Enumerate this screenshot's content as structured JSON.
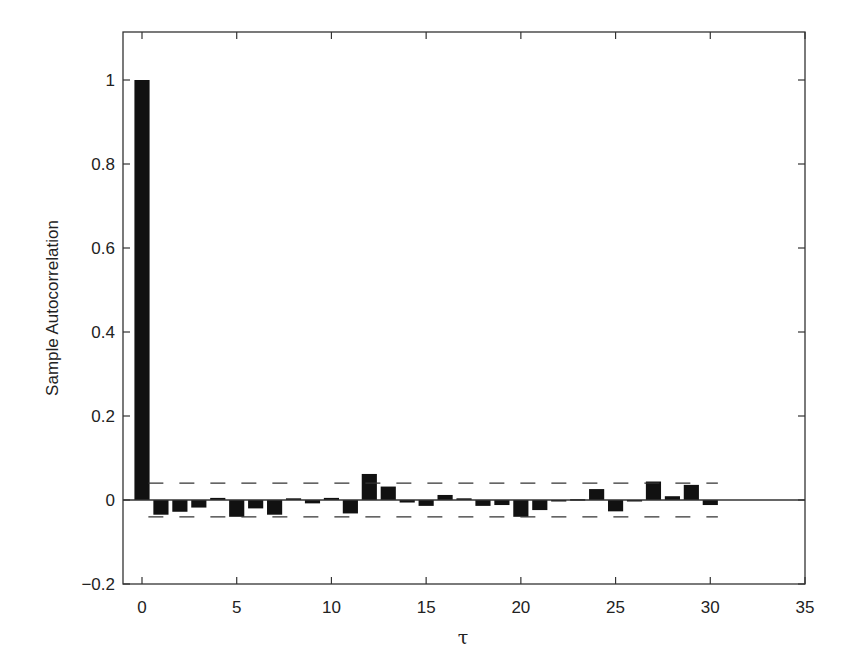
{
  "chart_data": {
    "type": "bar",
    "title": "",
    "xlabel": "τ",
    "ylabel": "Sample Autocorrelation",
    "xlim": [
      -1,
      35
    ],
    "ylim": [
      -0.2,
      1.1
    ],
    "xticks": [
      0,
      5,
      10,
      15,
      20,
      25,
      30,
      35
    ],
    "yticks": [
      -0.2,
      0,
      0.2,
      0.4,
      0.6,
      0.8,
      1
    ],
    "ytick_labels": [
      "−0.2",
      "0",
      "0.2",
      "0.4",
      "0.6",
      "0.8",
      "1"
    ],
    "xtick_labels": [
      "0",
      "5",
      "10",
      "15",
      "20",
      "25",
      "30",
      "35"
    ],
    "grid": false,
    "legend": null,
    "categories": [
      0,
      1,
      2,
      3,
      4,
      5,
      6,
      7,
      8,
      9,
      10,
      11,
      12,
      13,
      14,
      15,
      16,
      17,
      18,
      19,
      20,
      21,
      22,
      23,
      24,
      25,
      26,
      27,
      28,
      29,
      30
    ],
    "values": [
      1.0,
      -0.035,
      -0.028,
      -0.018,
      0.005,
      -0.04,
      -0.02,
      -0.035,
      0.004,
      -0.008,
      0.005,
      -0.032,
      0.062,
      0.032,
      -0.006,
      -0.014,
      0.012,
      0.004,
      -0.014,
      -0.012,
      -0.04,
      -0.024,
      -0.002,
      0.002,
      0.026,
      -0.027,
      -0.001,
      0.044,
      0.009,
      0.036,
      -0.012
    ],
    "confidence_bounds": {
      "upper": 0.04,
      "lower": -0.04,
      "style": "dashed",
      "x_range": [
        1,
        30
      ]
    },
    "bar_color": "#111111",
    "zero_line_range": [
      -1,
      35
    ]
  }
}
